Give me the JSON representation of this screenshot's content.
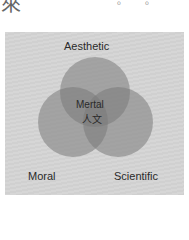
{
  "header": {
    "partial_char": "來",
    "punctuation": [
      "。",
      "。"
    ]
  },
  "diagram": {
    "title": "",
    "background_color": "#d4d4d4",
    "circles": [
      {
        "name": "Aesthetic",
        "label": "Aesthetic",
        "cx": 95,
        "cy": 92,
        "r": 35,
        "color": "#8a8a8a"
      },
      {
        "name": "Moral",
        "label": "Moral",
        "cx": 73,
        "cy": 122,
        "r": 35,
        "color": "#8a8a8a"
      },
      {
        "name": "Scientific",
        "label": "Scientific",
        "cx": 118,
        "cy": 122,
        "r": 35,
        "color": "#8a8a8a"
      }
    ],
    "center_label_en": "Mertal",
    "center_label_zh": "人文"
  }
}
